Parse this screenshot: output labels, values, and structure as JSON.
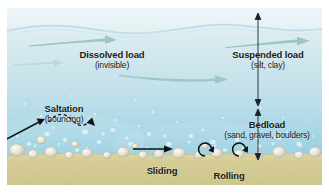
{
  "diagram": {
    "labels": [
      {
        "id": "dissolved",
        "main": "Dissolved load",
        "sub": "(invisible)"
      },
      {
        "id": "suspended",
        "main": "Suspended load",
        "sub": "(silt, clay)"
      },
      {
        "id": "saltation",
        "main": "Saltation",
        "sub": "(bouncing)"
      },
      {
        "id": "bedload",
        "main": "Bedload",
        "sub": "(sand, gravel, boulders)"
      },
      {
        "id": "sliding",
        "main": "Sliding",
        "sub": ""
      },
      {
        "id": "rolling",
        "main": "Rolling",
        "sub": ""
      }
    ],
    "dissolved_load": {
      "main": "Dissolved load",
      "sub": "(invisible)"
    },
    "suspended_load": {
      "main": "Suspended load",
      "sub": "(silt, clay)"
    },
    "saltation": {
      "main": "Saltation",
      "sub": "(bouncing)"
    },
    "bedload": {
      "main": "Bedload",
      "sub": "(sand, gravel, boulders)"
    },
    "sliding": {
      "main": "Sliding",
      "sub": ""
    },
    "rolling": {
      "main": "Rolling",
      "sub": ""
    },
    "colors": {
      "water_top": "#d6eaf0",
      "water_mid": "#bfdde8",
      "water_deep": "#8ecbe0",
      "sand": "#d8cf9b",
      "sand_shadow": "#c6bd87",
      "flow_arrow": "#8fbcb8",
      "annotation_arrow": "#111111",
      "grain": "#e6e2d2",
      "frame": "#ffffff",
      "text": "#1a1a16"
    },
    "icons": {
      "flow_arrow": "flow-arrow-icon",
      "suspended_span_arrow": "double-headed-vertical-arrow-icon",
      "bedload_span_arrow": "double-headed-vertical-arrow-icon",
      "saltation_path": "dashed-bouncing-arrow-icon",
      "saltation_pointer": "straight-arrow-icon",
      "sliding_arrow": "straight-arrow-icon",
      "rolling_arrow": "circular-rotation-arrow-icon"
    }
  }
}
